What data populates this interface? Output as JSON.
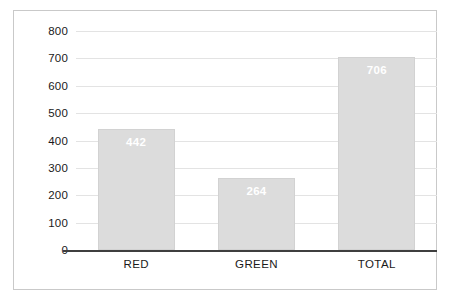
{
  "chart_data": {
    "type": "bar",
    "title": "",
    "subtitle": "",
    "xlabel": "",
    "ylabel": "",
    "categories": [
      "RED",
      "GREEN",
      "TOTAL"
    ],
    "values": [
      442,
      264,
      706
    ],
    "data_labels": [
      "442",
      "264",
      "706"
    ],
    "ylim": [
      0,
      800
    ],
    "ytick_step": 100,
    "ytick_labels": [
      "800",
      "700",
      "600",
      "500",
      "400",
      "300",
      "200",
      "100",
      "0"
    ],
    "ytick_values": [
      800,
      700,
      600,
      500,
      400,
      300,
      200,
      100,
      0
    ],
    "grid": true,
    "legend": false,
    "legend_position": "none",
    "series": [
      {
        "name": "",
        "values": [
          442,
          264,
          706
        ]
      }
    ],
    "colors": {
      "bar_fill": "#dcdcdc",
      "bar_border": "#d2d2d2",
      "gridline": "#e3e3e3",
      "axis_line": "#3f3f3f",
      "frame_border": "#c9c9c9",
      "label_text": "#1a1a1a",
      "value_text": "#ffffff",
      "background": "#ffffff"
    }
  }
}
